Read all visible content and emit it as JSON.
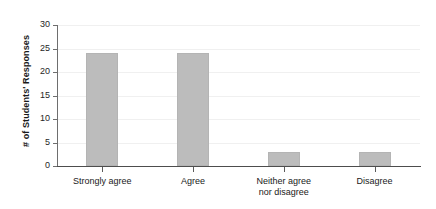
{
  "chart_data": {
    "type": "bar",
    "title": "",
    "subtitle": "",
    "xlabel": "",
    "ylabel": "# of Students' Responses",
    "categories": [
      "Strongly agree",
      "Agree",
      "Neither agree nor disagree",
      "Disagree"
    ],
    "category_lines": [
      [
        "Strongly agree"
      ],
      [
        "Agree"
      ],
      [
        "Neither agree",
        "nor disagree"
      ],
      [
        "Disagree"
      ]
    ],
    "values": [
      24,
      24,
      3,
      3
    ],
    "ylim": [
      0,
      30
    ],
    "ytick_labels": [
      "0",
      "5",
      "10",
      "15",
      "20",
      "25",
      "30"
    ],
    "ytick_values": [
      0,
      5,
      10,
      15,
      20,
      25,
      30
    ],
    "grid": true,
    "grid_axis": "y",
    "legend": false,
    "legend_position": "none",
    "annotations": [],
    "colors": {
      "bar_fill": "#bcbcbc",
      "bar_stroke": "#b4b4b4",
      "gridline": "#f0f0f0",
      "axis": "#4d4d4d",
      "text": "#1a1a1a",
      "background": "#ffffff"
    }
  }
}
